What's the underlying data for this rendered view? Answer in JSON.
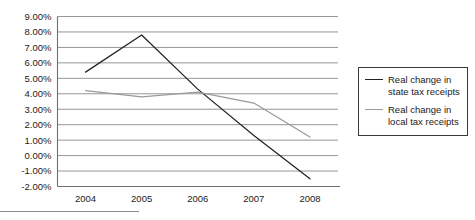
{
  "chart_data": {
    "type": "line",
    "title": "",
    "xlabel": "",
    "ylabel": "",
    "x": [
      "2004",
      "2005",
      "2006",
      "2007",
      "2008"
    ],
    "categories": [
      "2004",
      "2005",
      "2006",
      "2007",
      "2008"
    ],
    "series": [
      {
        "name": "Real change in state tax receipts",
        "legend_label": "Real change in\nstate tax receipts",
        "color": "#222222",
        "values": [
          5.4,
          7.8,
          4.3,
          1.3,
          -1.5
        ]
      },
      {
        "name": "Real change in local tax receipts",
        "legend_label": "Real change in\nlocal tax receipts",
        "color": "#9a9a9a",
        "values": [
          4.2,
          3.8,
          4.1,
          3.4,
          1.2
        ]
      }
    ],
    "ylim": [
      -2,
      9
    ],
    "ytick_values": [
      9,
      8,
      7,
      6,
      5,
      4,
      3,
      2,
      1,
      0,
      -1,
      -2
    ],
    "ytick_labels": [
      "9.00%",
      "8.00%",
      "7.00%",
      "6.00%",
      "5.00%",
      "4.00%",
      "3.00%",
      "2.00%",
      "1.00%",
      "0.00%",
      "-1.00%",
      "-2.00%"
    ],
    "grid": true,
    "grid_color": "#8a8a8a",
    "legend_position": "right",
    "axis_color": "#6f6f6f"
  },
  "legend": {
    "entries": [
      {
        "label": "Real change in\nstate tax receipts",
        "color": "#222222"
      },
      {
        "label": "Real change in\nlocal tax receipts",
        "color": "#9a9a9a"
      }
    ]
  }
}
